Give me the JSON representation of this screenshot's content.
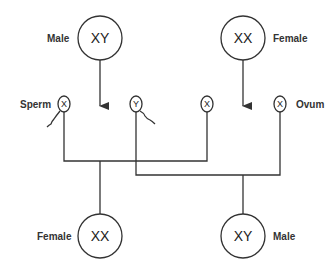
{
  "parents": {
    "male": {
      "label": "Male",
      "chromosomes": "XY"
    },
    "female": {
      "label": "Female",
      "chromosomes": "XX"
    }
  },
  "gametes": {
    "sperm_label": "Sperm",
    "ovum_label": "Ovum",
    "sperm": [
      {
        "chromosome": "X"
      },
      {
        "chromosome": "Y"
      }
    ],
    "ova": [
      {
        "chromosome": "X"
      },
      {
        "chromosome": "X"
      }
    ]
  },
  "offspring": {
    "female": {
      "label": "Female",
      "chromosomes": "XX"
    },
    "male": {
      "label": "Male",
      "chromosomes": "XY"
    }
  },
  "colors": {
    "stroke": "#333333",
    "background": "#ffffff"
  }
}
